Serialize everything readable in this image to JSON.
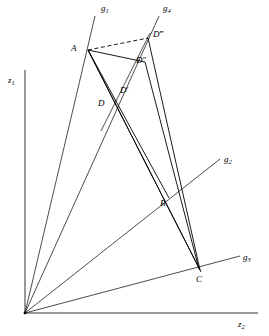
{
  "figure": {
    "background": "#ffffff",
    "stroke_color": "#000000",
    "axes": {
      "vertical_label": "z",
      "vertical_sub": "1",
      "horizontal_label": "z",
      "horizontal_sub": "2",
      "origin": [
        25,
        313
      ]
    },
    "rays": [
      {
        "name": "g1",
        "label": "g",
        "sub": "1",
        "label_pos": [
          101,
          6
        ],
        "from": [
          25,
          313
        ],
        "to": [
          95,
          16
        ]
      },
      {
        "name": "g2",
        "label": "g",
        "sub": "2",
        "label_pos": [
          224,
          158
        ],
        "from": [
          25,
          313
        ],
        "to": [
          218,
          160
        ]
      },
      {
        "name": "g3",
        "label": "g",
        "sub": "3",
        "label_pos": [
          243,
          256
        ],
        "from": [
          25,
          313
        ],
        "to": [
          238,
          257
        ]
      },
      {
        "name": "g4",
        "label": "g",
        "sub": "4",
        "label_pos": [
          163,
          6
        ],
        "from": [
          25,
          313
        ],
        "to": [
          159,
          16
        ]
      }
    ],
    "points": [
      {
        "name": "A",
        "label": "A",
        "x": 88,
        "y": 50,
        "label_pos": [
          73,
          45
        ]
      },
      {
        "name": "B",
        "label": "B",
        "x": 168,
        "y": 196,
        "label_pos": [
          161,
          203
        ]
      },
      {
        "name": "C",
        "label": "C",
        "x": 200,
        "y": 270,
        "label_pos": [
          196,
          281
        ]
      },
      {
        "name": "D",
        "label": "D",
        "x": 113,
        "y": 106,
        "label_pos": [
          100,
          104
        ]
      },
      {
        "name": "Dp",
        "label": "D′",
        "x": 133,
        "y": 95,
        "label_pos": [
          122,
          92
        ]
      },
      {
        "name": "Dpp",
        "label": "D″",
        "x": 145,
        "y": 62,
        "label_pos": [
          135,
          61
        ]
      },
      {
        "name": "Dppp",
        "label": "D‴",
        "x": 148,
        "y": 38,
        "label_pos": [
          155,
          35
        ]
      }
    ],
    "segments": [
      {
        "from": "A",
        "to": "Dpp",
        "style": "solid"
      },
      {
        "from": "A",
        "to": "C",
        "style": "solid"
      },
      {
        "from": "A",
        "to": "B",
        "style": "solid"
      },
      {
        "from": "A",
        "to": "Dppp",
        "style": "dashed"
      },
      {
        "from": "Dppp",
        "to": "C",
        "style": "solid"
      },
      {
        "from": "Dpp",
        "to": "C",
        "style": "solid"
      },
      {
        "from": "D",
        "to": "Dppp",
        "style": "solid"
      },
      {
        "from": "Dp",
        "to": "C",
        "style": "solid"
      }
    ]
  }
}
